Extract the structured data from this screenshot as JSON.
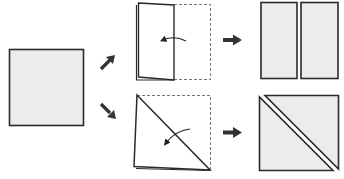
{
  "diagram": {
    "title": "Cutting a square into two rectangles or two triangles",
    "colors": {
      "paper_fill": "#ececec",
      "folded_fill": "#ffffff",
      "outline": "#2a2a2a",
      "dashed": "#777777",
      "arrow": "#333333"
    },
    "steps": [
      {
        "id": "start",
        "label": "Square piece of paper"
      },
      {
        "id": "fold-half",
        "label": "Fold in half vertically (rectangle fold)"
      },
      {
        "id": "result-rectangles",
        "label": "Two rectangles"
      },
      {
        "id": "fold-diagonal",
        "label": "Fold diagonally (triangle fold)"
      },
      {
        "id": "result-triangles",
        "label": "Two triangles"
      }
    ]
  }
}
